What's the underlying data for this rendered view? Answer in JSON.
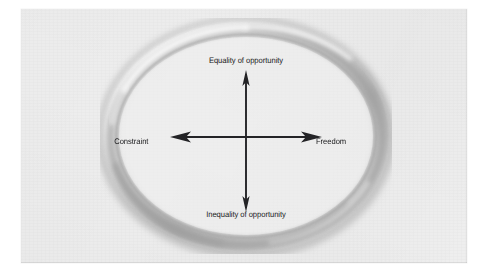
{
  "figure": {
    "type": "conceptual-axis-diagram",
    "shape": "torus-ring",
    "background_color": "#eeeeee",
    "page_color": "#ffffff",
    "ring_highlight_color": "#f4f4f4",
    "ring_shadow_color": "#9a9a9a",
    "arrow_color": "#232326",
    "text_color": "#18181a",
    "axes": {
      "vertical": {
        "top_label": "Equality of opportunity",
        "bottom_label": "Inequality of opportunity"
      },
      "horizontal": {
        "left_label": "Constraint",
        "right_label": "Freedom"
      }
    }
  }
}
